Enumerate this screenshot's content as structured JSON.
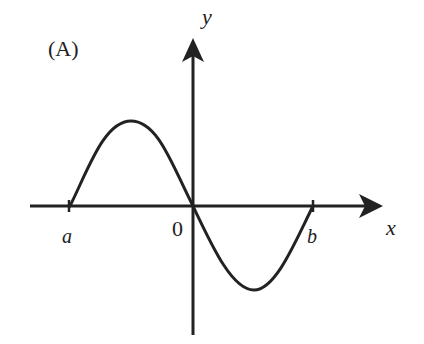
{
  "figure": {
    "panel_label": "(A)",
    "axes": {
      "x_label": "x",
      "y_label": "y",
      "origin_label": "0"
    },
    "ticks": {
      "left": "a",
      "right": "b"
    },
    "curve": {
      "description": "sine-like curve from a to b: rises to a maximum between a and 0, passes through the origin decreasing, reaches a minimum between 0 and b, returns to zero at b",
      "points": [
        {
          "name": "a",
          "x_px": 70,
          "y_px": 206
        },
        {
          "name": "max",
          "x_px": 131,
          "y_px": 121
        },
        {
          "name": "origin",
          "x_px": 193,
          "y_px": 206
        },
        {
          "name": "min",
          "x_px": 254,
          "y_px": 290
        },
        {
          "name": "b",
          "x_px": 313,
          "y_px": 206
        }
      ]
    },
    "colors": {
      "ink": "#222222",
      "background": "#ffffff"
    }
  }
}
